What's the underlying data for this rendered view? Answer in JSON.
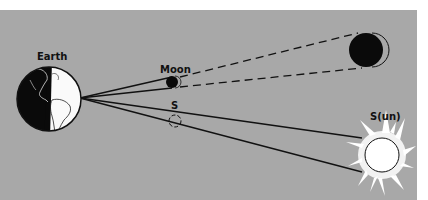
{
  "diagram": {
    "labels": {
      "earth": "Earth",
      "moon": "Moon",
      "sun_small": "S",
      "sun_large": "S(un)"
    },
    "colors": {
      "background": "#a8a8a8",
      "ink": "#111111",
      "paper": "#ffffff"
    }
  }
}
